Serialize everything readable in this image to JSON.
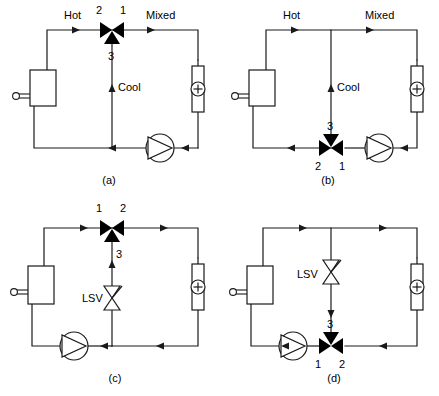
{
  "figure": {
    "title": "",
    "type": "hydronic-three-way-valve-arrangements",
    "panel_count": 4
  },
  "common": {
    "labels": {
      "hot": "Hot",
      "mixed": "Mixed",
      "cool": "Cool",
      "lsv": "LSV"
    },
    "components": {
      "boiler": "boiler-vessel",
      "pump": "circulating-pump",
      "coil": "heating-coil",
      "valve3way": "three-way-valve",
      "balancing_valve": "line-size-valve"
    },
    "colors": {
      "line": "#1a1a1a",
      "fill": "#000000",
      "background": "#ffffff"
    }
  },
  "panels": [
    {
      "id": "a",
      "caption": "(a)",
      "arrangement": "mixing-valve-in-supply",
      "valve": {
        "orientation": "horizontal",
        "port_left": "2",
        "port_right": "1",
        "port_stem": "3",
        "stem_side": "bottom",
        "position": "supply-top"
      },
      "labels_shown": [
        "Hot",
        "Mixed",
        "Cool"
      ],
      "has_lsv": false,
      "pump_position": "bottom-right",
      "text": {
        "hot": "Hot",
        "mixed": "Mixed",
        "cool": "Cool",
        "p1": "1",
        "p2": "2",
        "p3": "3"
      }
    },
    {
      "id": "b",
      "caption": "(b)",
      "arrangement": "mixing-valve-in-return",
      "valve": {
        "orientation": "horizontal",
        "port_left": "2",
        "port_right": "1",
        "port_stem": "3",
        "stem_side": "top",
        "position": "return-bottom"
      },
      "labels_shown": [
        "Hot",
        "Mixed",
        "Cool"
      ],
      "has_lsv": false,
      "pump_position": "bottom-right",
      "text": {
        "hot": "Hot",
        "mixed": "Mixed",
        "cool": "Cool",
        "p1": "1",
        "p2": "2",
        "p3": "3"
      }
    },
    {
      "id": "c",
      "caption": "(c)",
      "arrangement": "diverting-valve-in-supply-with-lsv",
      "valve": {
        "orientation": "horizontal",
        "port_left": "1",
        "port_right": "2",
        "port_stem": "3",
        "stem_side": "bottom",
        "position": "supply-top"
      },
      "labels_shown": [
        "LSV"
      ],
      "has_lsv": true,
      "pump_position": "bottom-left",
      "text": {
        "lsv": "LSV",
        "p1": "1",
        "p2": "2",
        "p3": "3"
      }
    },
    {
      "id": "d",
      "caption": "(d)",
      "arrangement": "diverting-valve-in-return-with-lsv",
      "valve": {
        "orientation": "horizontal",
        "port_left": "1",
        "port_right": "2",
        "port_stem": "3",
        "stem_side": "top",
        "position": "return-bottom"
      },
      "labels_shown": [
        "LSV"
      ],
      "has_lsv": true,
      "pump_position": "bottom-left",
      "text": {
        "lsv": "LSV",
        "p1": "1",
        "p2": "2",
        "p3": "3"
      }
    }
  ]
}
